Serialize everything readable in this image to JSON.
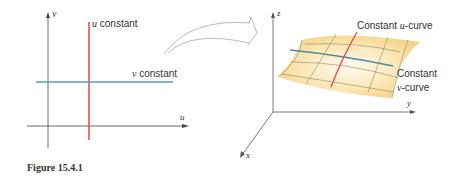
{
  "left_panel": {
    "axis_v_label": "v",
    "axis_u_label": "u",
    "u_line": {
      "var": "u",
      "text": " constant",
      "color": "#e8534a"
    },
    "v_line": {
      "var": "v",
      "text": " constant",
      "color": "#5b9ab8"
    }
  },
  "right_panel": {
    "axis_z_label": "z",
    "axis_y_label": "y",
    "axis_x_label": "x",
    "u_curve_label": {
      "prefix": "Constant ",
      "var": "u",
      "suffix": "-curve"
    },
    "v_curve_label": {
      "line1": "Constant",
      "var": "v",
      "suffix": "-curve"
    },
    "surface_color": "#f7d98e",
    "u_curve_color": "#e8534a",
    "v_curve_color": "#4f8aa3"
  },
  "caption": "Figure 15.4.1"
}
